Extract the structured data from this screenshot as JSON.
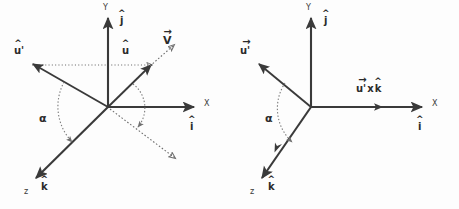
{
  "figure": {
    "background_color": "#fdfdfd",
    "stroke_color": "#3a3a3a",
    "dotted_color": "#6b6b6b"
  },
  "panels": [
    {
      "id": "left",
      "name": "left-diagram",
      "origin": {
        "x": 108,
        "y": 107
      },
      "axes": [
        {
          "name": "y-axis",
          "label": "Y",
          "unit": "j",
          "accent": "hat",
          "label_pos": {
            "x": 103,
            "y": 4
          },
          "unit_pos": {
            "x": 120,
            "y": 16
          }
        },
        {
          "name": "x-axis",
          "label": "X",
          "unit": "i",
          "accent": "hat",
          "label_pos": {
            "x": 204,
            "y": 100
          },
          "unit_pos": {
            "x": 190,
            "y": 122
          }
        },
        {
          "name": "z-axis",
          "label": "z",
          "unit": "k",
          "accent": "hat",
          "label_pos": {
            "x": 24,
            "y": 188
          },
          "unit_pos": {
            "x": 41,
            "y": 182
          }
        }
      ],
      "vectors": [
        {
          "name": "u-prime-vector",
          "label": "u'",
          "accent": "hat",
          "style": "solid",
          "label_pos": {
            "x": 14,
            "y": 46
          }
        },
        {
          "name": "u-vector",
          "label": "u",
          "accent": "hat",
          "style": "solid",
          "label_pos": {
            "x": 122,
            "y": 46
          }
        },
        {
          "name": "v-vector",
          "label": "V",
          "accent": "arrow",
          "style": "dotted",
          "label_pos": {
            "x": 163,
            "y": 35
          }
        }
      ],
      "angle": {
        "name": "alpha-angle",
        "label": "α",
        "label_pos": {
          "x": 39,
          "y": 113
        }
      }
    },
    {
      "id": "right",
      "name": "right-diagram",
      "origin": {
        "x": 311,
        "y": 107
      },
      "axes": [
        {
          "name": "y-axis",
          "label": "Y",
          "unit": "j",
          "accent": "hat",
          "label_pos": {
            "x": 306,
            "y": 4
          },
          "unit_pos": {
            "x": 324,
            "y": 16
          }
        },
        {
          "name": "x-axis",
          "label": "X",
          "unit": "i",
          "accent": "hat",
          "label_pos": {
            "x": 432,
            "y": 100
          },
          "unit_pos": {
            "x": 418,
            "y": 122
          }
        },
        {
          "name": "z-axis",
          "label": "z",
          "unit": "k",
          "accent": "hat",
          "label_pos": {
            "x": 250,
            "y": 188
          },
          "unit_pos": {
            "x": 268,
            "y": 182
          }
        }
      ],
      "vectors": [
        {
          "name": "u-prime-vector",
          "label": "u'",
          "accent": "arrow",
          "style": "solid",
          "label_pos": {
            "x": 240,
            "y": 46
          }
        }
      ],
      "cross_product": {
        "name": "u-prime-cross-k-label",
        "left_operand": "u'",
        "left_accent": "arrow",
        "operator": "x",
        "right_operand": "k",
        "right_accent": "hat",
        "label_pos": {
          "x": 356,
          "y": 84
        }
      },
      "angle": {
        "name": "alpha-angle",
        "label": "α",
        "label_pos": {
          "x": 265,
          "y": 113
        }
      }
    }
  ]
}
